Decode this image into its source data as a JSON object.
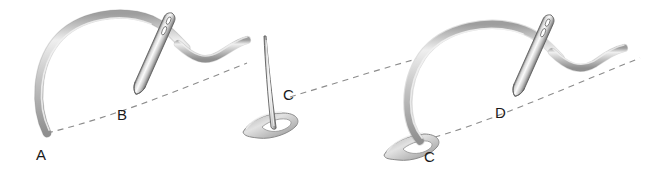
{
  "figure": {
    "background_color": "#ffffff",
    "width": 647,
    "height": 174,
    "guideline": {
      "name": "stitch guideline",
      "style": "dashed",
      "color": "#8c8c8c"
    },
    "thread_color": "#bdbdbd",
    "thread_edge_color": "#8a8a8a",
    "needle_color": "#d0d0d0",
    "needle_edge_color": "#6e6e6e",
    "label_color": "#1a1a1a"
  },
  "panels": [
    {
      "id": "panel-1",
      "name": "step-one",
      "description": "Needle pierces down at B; thread arcs up from A",
      "labels": [
        {
          "id": "label-a",
          "text": "A",
          "x": 36,
          "y": 160
        },
        {
          "id": "label-b",
          "text": "B",
          "x": 117,
          "y": 120
        }
      ]
    },
    {
      "id": "panel-2",
      "name": "step-two",
      "description": "Needle emerges point-up through thread loop at C",
      "labels": [
        {
          "id": "label-c-mid",
          "text": "C",
          "x": 283,
          "y": 100
        }
      ]
    },
    {
      "id": "panel-3",
      "name": "step-three",
      "description": "Thread looped at C; needle pierces down at D",
      "labels": [
        {
          "id": "label-c-right",
          "text": "C",
          "x": 424,
          "y": 162
        },
        {
          "id": "label-d",
          "text": "D",
          "x": 495,
          "y": 118
        }
      ]
    }
  ]
}
